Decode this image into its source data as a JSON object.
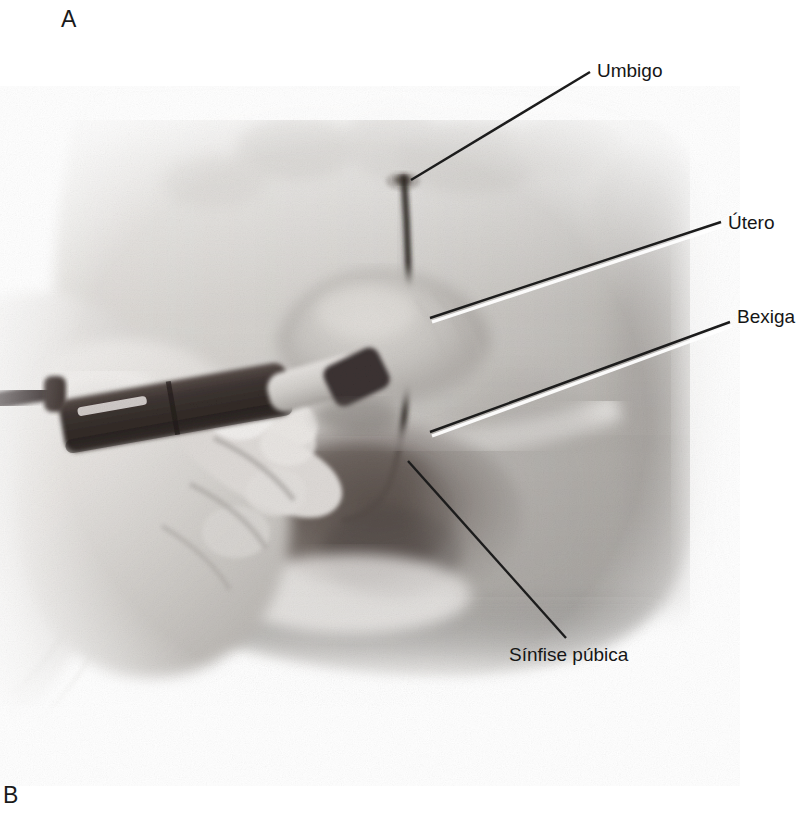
{
  "figure": {
    "panels": [
      {
        "id": "A",
        "letter": "A"
      },
      {
        "id": "B",
        "letter": "B"
      }
    ],
    "panel_a": {
      "description": "Grayscale photograph of a clinician's gloved hand holding an ultrasound transducer pressed against a patient's lower abdomen, with a vertical ink marker line drawn from the umbilicus down the midline.",
      "annotations": [
        {
          "key": "umbigo",
          "label": "Umbigo",
          "leader": {
            "x1": 411,
            "y1": 180,
            "x2": 590,
            "y2": 72
          }
        },
        {
          "key": "utero",
          "label": "Útero",
          "leader": {
            "x1": 430,
            "y1": 318,
            "x2": 721,
            "y2": 222
          }
        },
        {
          "key": "bexiga",
          "label": "Bexiga",
          "leader": {
            "x1": 430,
            "y1": 432,
            "x2": 730,
            "y2": 322
          }
        },
        {
          "key": "sinfise_pubica",
          "label": "Sínfise púbica",
          "leader": {
            "x1": 408,
            "y1": 461,
            "x2": 566,
            "y2": 638
          }
        }
      ]
    }
  },
  "colors": {
    "page_background": "#ffffff",
    "text": "#161616",
    "leader_line": "#1c1c1c",
    "leader_highlight": "#ffffff",
    "skin_light": "#e9e7e4",
    "skin_mid": "#c9c6c2",
    "skin_shadow": "#9b9793",
    "probe_dark": "#3a3230",
    "marker_ink": "#2b2522"
  }
}
